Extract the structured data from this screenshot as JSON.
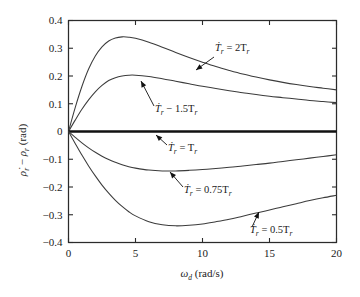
{
  "chart_data": {
    "type": "line",
    "title": "",
    "xlabel": "ω_d (rad/s)",
    "ylabel": "ρ̇_r − ρ_r (rad)",
    "xlim": [
      0,
      20
    ],
    "ylim": [
      -0.4,
      0.4
    ],
    "grid": false,
    "legend_position": "inline-annotations",
    "xticks": [
      "0",
      "5",
      "10",
      "15",
      "20"
    ],
    "xtick_values": [
      0,
      5,
      10,
      15,
      20
    ],
    "yticks": [
      "0.4",
      "0.3",
      "0.2",
      "0.1",
      "0",
      "−0.1",
      "−0.2",
      "−0.3",
      "−0.4"
    ],
    "ytick_values": [
      0.4,
      0.3,
      0.2,
      0.1,
      0,
      -0.1,
      -0.2,
      -0.3,
      -0.4
    ],
    "x": [
      0,
      0.5,
      1,
      1.5,
      2,
      2.5,
      3,
      3.5,
      4,
      4.5,
      5,
      6,
      7,
      8,
      9,
      10,
      11,
      12,
      13,
      14,
      15,
      16,
      17,
      18,
      19,
      20
    ],
    "series": [
      {
        "name": "Tdot_r = 2 T_r",
        "label": "2T",
        "values": [
          0,
          0.086,
          0.162,
          0.225,
          0.272,
          0.305,
          0.326,
          0.337,
          0.341,
          0.34,
          0.336,
          0.322,
          0.304,
          0.285,
          0.267,
          0.25,
          0.234,
          0.22,
          0.207,
          0.196,
          0.186,
          0.177,
          0.169,
          0.162,
          0.156,
          0.15
        ]
      },
      {
        "name": "Tdot_r = 1.5 T_r",
        "label": "1.5T",
        "values": [
          0,
          0.041,
          0.08,
          0.114,
          0.143,
          0.166,
          0.184,
          0.194,
          0.2,
          0.203,
          0.203,
          0.198,
          0.19,
          0.181,
          0.172,
          0.163,
          0.155,
          0.147,
          0.14,
          0.133,
          0.127,
          0.122,
          0.117,
          0.112,
          0.108,
          0.104
        ]
      },
      {
        "name": "Tdot_r = T_r",
        "label": "T",
        "values": [
          0,
          0,
          0,
          0,
          0,
          0,
          0,
          0,
          0,
          0,
          0,
          0,
          0,
          0,
          0,
          0,
          0,
          0,
          0,
          0,
          0,
          0,
          0,
          0,
          0,
          0
        ]
      },
      {
        "name": "Tdot_r = 0.75 T_r",
        "label": "0.75T",
        "values": [
          0,
          -0.021,
          -0.041,
          -0.059,
          -0.075,
          -0.089,
          -0.101,
          -0.111,
          -0.12,
          -0.127,
          -0.132,
          -0.139,
          -0.142,
          -0.142,
          -0.14,
          -0.137,
          -0.133,
          -0.129,
          -0.124,
          -0.119,
          -0.114,
          -0.108,
          -0.102,
          -0.096,
          -0.09,
          -0.084
        ]
      },
      {
        "name": "Tdot_r = 0.5 T_r",
        "label": "0.5T",
        "values": [
          0,
          -0.043,
          -0.085,
          -0.124,
          -0.16,
          -0.193,
          -0.222,
          -0.248,
          -0.27,
          -0.289,
          -0.304,
          -0.325,
          -0.336,
          -0.34,
          -0.338,
          -0.333,
          -0.325,
          -0.316,
          -0.305,
          -0.294,
          -0.283,
          -0.271,
          -0.26,
          -0.249,
          -0.239,
          -0.23
        ]
      }
    ],
    "annotations": [
      {
        "id": "ann-2Tr",
        "prefix": "T",
        "sub": "r",
        "eq": " = 2T",
        "eq_sub": "r",
        "text": "Ṫ_r = 2T_r",
        "label_x": 215,
        "label_y": 51,
        "arrow_from_x": 214,
        "arrow_from_y": 57,
        "arrow_to_x": 196,
        "arrow_to_y": 70
      },
      {
        "id": "ann-1p5Tr",
        "prefix": "T",
        "sub": "r",
        "eq": " − 1.5T",
        "eq_sub": "r",
        "text": "Ṫ_r − 1.5T_r",
        "label_x": 155,
        "label_y": 112,
        "arrow_from_x": 154,
        "arrow_from_y": 106,
        "arrow_to_x": 141,
        "arrow_to_y": 81
      },
      {
        "id": "ann-Tr",
        "prefix": "T",
        "sub": "r",
        "eq": " = T",
        "eq_sub": "r",
        "text": "Ṫ_r = T_r",
        "label_x": 168,
        "label_y": 151,
        "arrow_from_x": 167,
        "arrow_from_y": 145,
        "arrow_to_x": 156,
        "arrow_to_y": 135
      },
      {
        "id": "ann-0p75Tr",
        "prefix": "T",
        "sub": "r",
        "eq": " = 0.75T",
        "eq_sub": "r",
        "text": "Ṫ_r = 0.75T_r",
        "label_x": 184,
        "label_y": 193,
        "arrow_from_x": 183,
        "arrow_from_y": 187,
        "arrow_to_x": 170,
        "arrow_to_y": 172
      },
      {
        "id": "ann-0p5Tr",
        "prefix": "T",
        "sub": "r",
        "eq": " = 0.5T",
        "eq_sub": "r",
        "text": "Ṫ_r = 0.5T_r",
        "label_x": 250,
        "label_y": 233,
        "arrow_from_x": 252,
        "arrow_from_y": 227,
        "arrow_to_x": 259,
        "arrow_to_y": 212
      }
    ]
  },
  "axes": {
    "y_label_parts": {
      "rho_dot": "ρ̇",
      "sub_r": "r",
      "minus": " − ",
      "rho": "ρ",
      "unit": " (rad)"
    },
    "x_label_parts": {
      "omega": "ω",
      "sub_d": "d",
      "unit": " (rad/s)"
    }
  },
  "colors": {
    "curve": "#3b3b3b",
    "flat_curve": "#111111",
    "frame": "#2b2b2b",
    "text": "#1a1a1a",
    "background": "#ffffff"
  }
}
